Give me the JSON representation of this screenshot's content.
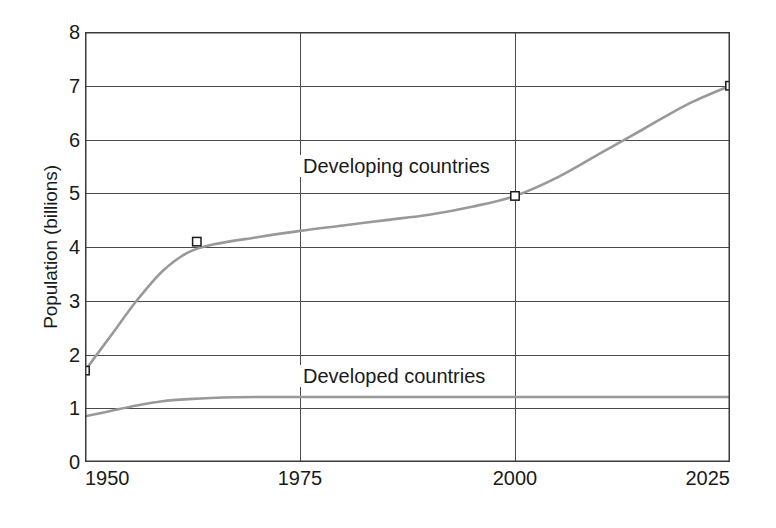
{
  "chart_data": {
    "type": "line",
    "title": "",
    "xlabel": "",
    "ylabel": "Population (billions)",
    "xlim": [
      1950,
      2025
    ],
    "ylim": [
      0,
      8
    ],
    "grid": true,
    "legend_position": "inline-annotation",
    "x_ticks": [
      "1950",
      "1975",
      "2000",
      "2025"
    ],
    "x_tick_values": [
      1950,
      1975,
      2000,
      2025
    ],
    "y_ticks": [
      "0",
      "1",
      "2",
      "3",
      "4",
      "5",
      "6",
      "7",
      "8"
    ],
    "y_tick_values": [
      0,
      1,
      2,
      3,
      4,
      5,
      6,
      7,
      8
    ],
    "series": [
      {
        "name": "Developing countries",
        "color": "#999999",
        "marker": "square",
        "x": [
          1950,
          1953,
          1956,
          1959,
          1962,
          1965,
          1970,
          1975,
          1980,
          1985,
          1990,
          1995,
          2000,
          2005,
          2010,
          2015,
          2020,
          2025
        ],
        "values": [
          1.7,
          2.35,
          3.0,
          3.55,
          3.9,
          4.05,
          4.18,
          4.3,
          4.4,
          4.5,
          4.6,
          4.75,
          4.95,
          5.3,
          5.75,
          6.2,
          6.65,
          7.0
        ],
        "markers": [
          {
            "x": 1950,
            "y": 1.7
          },
          {
            "x": 1963,
            "y": 4.1
          },
          {
            "x": 2000,
            "y": 4.95
          },
          {
            "x": 2025,
            "y": 7.0
          }
        ]
      },
      {
        "name": "Developed countries",
        "color": "#999999",
        "marker": "none",
        "x": [
          1950,
          1953,
          1956,
          1959,
          1962,
          1966,
          1970,
          1975,
          1980,
          1990,
          2000,
          2010,
          2020,
          2025
        ],
        "values": [
          0.85,
          0.95,
          1.05,
          1.13,
          1.17,
          1.2,
          1.21,
          1.21,
          1.21,
          1.21,
          1.21,
          1.21,
          1.21,
          1.21
        ],
        "markers": []
      }
    ],
    "annotations": [
      {
        "text": "Developing countries",
        "series": "Developing countries"
      },
      {
        "text": "Developed countries",
        "series": "Developed countries"
      }
    ]
  },
  "axes": {
    "y_title": "Population (billions)",
    "y_tick_labels": [
      "8",
      "7",
      "6",
      "5",
      "4",
      "3",
      "2",
      "1",
      "0"
    ],
    "x_tick_labels": [
      "1950",
      "1975",
      "2000",
      "2025"
    ]
  },
  "colors": {
    "line": "#999999",
    "axis": "#3a3a3a",
    "grid": "#4a4a4a",
    "text": "#1a1a1a",
    "background": "#ffffff",
    "marker_fill": "#ffffff",
    "marker_stroke": "#1a1a1a"
  },
  "annotations": {
    "developing_label": "Developing countries",
    "developed_label": "Developed countries"
  }
}
